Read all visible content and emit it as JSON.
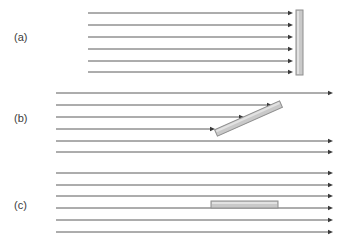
{
  "figure": {
    "width": 343,
    "height": 244,
    "background": "#ffffff"
  },
  "style": {
    "ray_color": "#5a5a5a",
    "arrow_color": "#3a3a3a",
    "obstacle_fill": "#c9c9c9",
    "obstacle_stroke": "#8e8e8e",
    "obstacle_highlight": "#e2e2e2",
    "label_color": "#3c3c3c",
    "ray_width": 1
  },
  "panels": [
    {
      "id": "a",
      "label": "(a)",
      "label_x": 14,
      "label_y": 41,
      "ray_count": 6,
      "ray_x_start": 88,
      "ray_y_values": [
        13,
        25,
        37,
        49,
        61,
        72
      ],
      "ray_x_end": [
        293,
        293,
        293,
        293,
        293,
        293
      ],
      "obstacle": {
        "name": "vertical-bar",
        "orientation": "perpendicular",
        "angle_deg": 90,
        "x": 296,
        "y": 10,
        "width": 7,
        "height": 65
      }
    },
    {
      "id": "b",
      "label": "(b)",
      "label_x": 14,
      "label_y": 122,
      "ray_count": 6,
      "ray_x_start": 56,
      "ray_y_values": [
        93,
        105,
        117,
        129,
        141,
        152
      ],
      "ray_x_end": [
        333,
        272,
        244,
        215,
        333,
        333
      ],
      "obstacle": {
        "name": "tilted-bar",
        "orientation": "oblique",
        "angle_deg": 24,
        "x1": 216,
        "y1": 133,
        "x2": 281,
        "y2": 104,
        "thickness": 7
      }
    },
    {
      "id": "c",
      "label": "(c)",
      "label_x": 14,
      "label_y": 209,
      "ray_count": 6,
      "ray_x_start": 56,
      "ray_y_values": [
        173,
        185,
        196,
        208,
        220,
        232
      ],
      "ray_x_end": [
        333,
        333,
        333,
        333,
        333,
        333
      ],
      "obstacle": {
        "name": "horizontal-bar",
        "orientation": "parallel",
        "angle_deg": 0,
        "x": 211,
        "y": 201,
        "width": 67,
        "height": 7
      }
    }
  ]
}
